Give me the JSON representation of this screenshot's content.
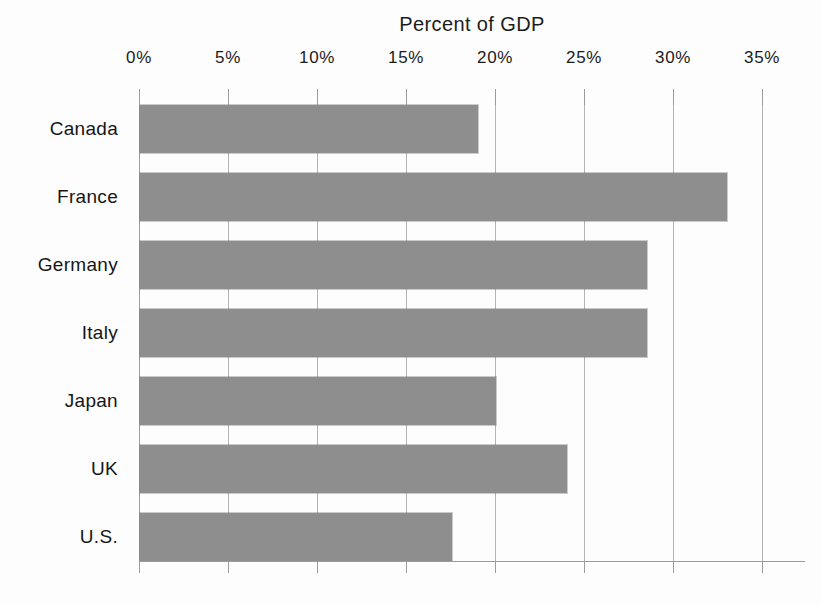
{
  "chart_data": {
    "type": "bar",
    "orientation": "horizontal",
    "title": "Percent of GDP",
    "categories": [
      "Canada",
      "France",
      "Germany",
      "Italy",
      "Japan",
      "UK",
      "U.S."
    ],
    "values": [
      19,
      33,
      28.5,
      28.5,
      20,
      24,
      17.5
    ],
    "x_ticks": [
      0,
      5,
      10,
      15,
      20,
      25,
      30,
      35
    ],
    "x_tick_labels": [
      "0%",
      "5%",
      "10%",
      "15%",
      "20%",
      "25%",
      "30%",
      "35%"
    ],
    "xlim": [
      0,
      37.4
    ],
    "xlabel": "",
    "ylabel": "",
    "grid": "vertical-gridlines-on",
    "legend": "none",
    "axis_position": "top",
    "bar_color": "#8e8e8e",
    "gridline_color": "#b3b3b3",
    "axis_color": "#9c9c9c",
    "background_color": "#fdfdfd"
  }
}
